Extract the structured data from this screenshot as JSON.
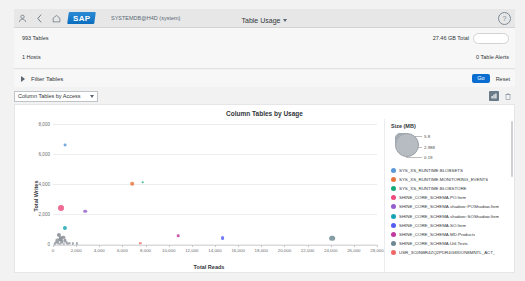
{
  "shell": {
    "user_icon": "person-icon",
    "back_icon": "chevron-left-icon",
    "home_icon": "home-icon",
    "logo_text": "SAP",
    "database": "SYSTEMDB@H4D (system)",
    "title": "Table Usage",
    "help_icon": "help-icon"
  },
  "summary": {
    "tables": "993 Tables",
    "total_size": "27.46 GB Total",
    "hosts": "1 Hosts",
    "alerts": "0 Table Alerts"
  },
  "filter": {
    "label": "Filter Tables",
    "go_label": "Go",
    "reset_label": "Reset",
    "expand_icon": "chevron-right-icon"
  },
  "selector": {
    "value": "Column Tables by Access",
    "chart_icon": "chart-settings-icon",
    "delete_icon": "trash-icon"
  },
  "chart_data": {
    "type": "scatter",
    "title": "Column Tables by Usage",
    "xlabel": "Total Reads",
    "ylabel": "Total Writes",
    "xlim": [
      0,
      28000
    ],
    "ylim": [
      0,
      8000
    ],
    "grid": true,
    "legend_position": "right",
    "xticks": [
      "0",
      "2,000",
      "4,000",
      "6,000",
      "8,000",
      "10,000",
      "12,000",
      "14,000",
      "16,000",
      "18,000",
      "20,000",
      "22,000",
      "24,000",
      "26,000",
      "28,000"
    ],
    "yticks": [
      "0",
      "2,000",
      "4,000",
      "6,000",
      "8,000"
    ],
    "size_legend": {
      "title": "Size (MB)",
      "max": "5.8",
      "mid": "2.988",
      "min": "0.19"
    },
    "series": [
      {
        "name": "SYS_XS_RUNTIME.BLOBSETS",
        "color": "#5899DA",
        "x": 1050,
        "y": 6650,
        "size": 1.1
      },
      {
        "name": "SYS_XS_RUNTIME.MONITORING_EVENTS",
        "color": "#E8743B",
        "x": 6850,
        "y": 4060,
        "size": 1.4
      },
      {
        "name": "SYS_XS_RUNTIME.BLOBSTORE",
        "color": "#19A979",
        "x": 7750,
        "y": 4180,
        "size": 1.0
      },
      {
        "name": "SHINE_CORE_SCHEMA.PO.Item",
        "color": "#ED4A7B",
        "x": 700,
        "y": 2500,
        "size": 2.3
      },
      {
        "name": "SHINE_CORE_SCHEMA.shadow::POShadow.Item",
        "color": "#945ECF",
        "x": 2800,
        "y": 2250,
        "size": 1.4
      },
      {
        "name": "SHINE_CORE_SCHEMA.shadow::SOShadow.Item",
        "color": "#13A4B4",
        "x": 1000,
        "y": 1150,
        "size": 1.6
      },
      {
        "name": "SHINE_CORE_SCHEMA.SO.Item",
        "color": "#525DF4",
        "x": 14650,
        "y": 450,
        "size": 1.5
      },
      {
        "name": "SHINE_CORE_SCHEMA.MD.Products",
        "color": "#BF399E",
        "x": 10800,
        "y": 620,
        "size": 1.0
      },
      {
        "name": "SHINE_CORE_SCHEMA.Util.Texts",
        "color": "#6C8893",
        "x": 24100,
        "y": 440,
        "size": 2.2
      },
      {
        "name": "USR_3C0NBR4ZQ2PDR4G8XION8MNTL_ACT_",
        "color": "#EE6868",
        "x": 7550,
        "y": 120,
        "size": 0.9
      }
    ],
    "cluster_points": [
      {
        "x": 380,
        "y": 300,
        "size": 1.2,
        "color": "#8c9299"
      },
      {
        "x": 520,
        "y": 640,
        "size": 1.6,
        "color": "#7f868d"
      },
      {
        "x": 660,
        "y": 420,
        "size": 1.8,
        "color": "#7a8188"
      },
      {
        "x": 760,
        "y": 210,
        "size": 1.4,
        "color": "#878d94"
      },
      {
        "x": 880,
        "y": 520,
        "size": 1.3,
        "color": "#828991"
      },
      {
        "x": 300,
        "y": 170,
        "size": 1.1,
        "color": "#8d939a"
      },
      {
        "x": 470,
        "y": 110,
        "size": 1.0,
        "color": "#939aa1"
      },
      {
        "x": 1020,
        "y": 300,
        "size": 1.2,
        "color": "#868d94"
      },
      {
        "x": 1180,
        "y": 160,
        "size": 1.0,
        "color": "#8b9198"
      },
      {
        "x": 1400,
        "y": 120,
        "size": 0.9,
        "color": "#8f959c"
      },
      {
        "x": 1700,
        "y": 100,
        "size": 0.8,
        "color": "#929aa0"
      },
      {
        "x": 2050,
        "y": 90,
        "size": 0.8,
        "color": "#949ba2"
      },
      {
        "x": 180,
        "y": 90,
        "size": 0.9,
        "color": "#979ea5"
      },
      {
        "x": 620,
        "y": 60,
        "size": 0.8,
        "color": "#9aa1a8"
      },
      {
        "x": 950,
        "y": 60,
        "size": 0.8,
        "color": "#9aa1a8"
      },
      {
        "x": 1300,
        "y": 50,
        "size": 0.7,
        "color": "#9ea5ac"
      }
    ]
  },
  "legend": {
    "items": [
      "SYS_XS_RUNTIME.BLOBSETS",
      "SYS_XS_RUNTIME.MONITORING_EVENTS",
      "SYS_XS_RUNTIME.BLOBSTORE",
      "SHINE_CORE_SCHEMA.PO.Item",
      "SHINE_CORE_SCHEMA.shadow::POShadow.Item",
      "SHINE_CORE_SCHEMA.shadow::SOShadow.Item",
      "SHINE_CORE_SCHEMA.SO.Item",
      "SHINE_CORE_SCHEMA.MD.Products",
      "SHINE_CORE_SCHEMA.Util.Texts",
      "USR_3C0NBR4ZQ2PDR4G8XION8MNTL_ACT_"
    ]
  }
}
